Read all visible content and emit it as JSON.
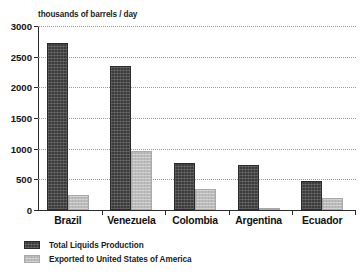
{
  "chart_data": {
    "type": "bar",
    "title": "thousands of barrels / day",
    "xlabel": "",
    "ylabel": "thousands of barrels / day",
    "ylim": [
      0,
      3000
    ],
    "yticks": [
      0,
      500,
      1000,
      1500,
      2000,
      2500,
      3000
    ],
    "ytick_labels": [
      "0",
      "500",
      "1000",
      "1500",
      "2000",
      "2500",
      "3000"
    ],
    "grid": true,
    "grid_style": "dotted-horizontal",
    "legend_position": "below-left",
    "categories": [
      "Brazil",
      "Venezuela",
      "Colombia",
      "Argentina",
      "Ecuador"
    ],
    "series": [
      {
        "name": "Total Liquids Production",
        "color": "#3c3c3c",
        "values": [
          2730,
          2350,
          770,
          735,
          480
        ]
      },
      {
        "name": "Exported to United States of America",
        "color": "#bcbcbc",
        "values": [
          240,
          960,
          340,
          30,
          195
        ]
      }
    ]
  },
  "axis": {
    "title": "thousands of barrels / day",
    "ticks": [
      {
        "label": "3000",
        "value": 3000
      },
      {
        "label": "2500",
        "value": 2500
      },
      {
        "label": "2000",
        "value": 2000
      },
      {
        "label": "1500",
        "value": 1500
      },
      {
        "label": "1000",
        "value": 1000
      },
      {
        "label": "500",
        "value": 500
      },
      {
        "label": "0",
        "value": 0
      }
    ]
  },
  "categories": [
    {
      "label": "Brazil"
    },
    {
      "label": "Venezuela"
    },
    {
      "label": "Colombia"
    },
    {
      "label": "Argentina"
    },
    {
      "label": "Ecuador"
    }
  ],
  "legend": {
    "items": [
      {
        "label": "Total Liquids Production",
        "color": "#3c3c3c"
      },
      {
        "label": "Exported to United States of America",
        "color": "#bcbcbc"
      }
    ]
  }
}
